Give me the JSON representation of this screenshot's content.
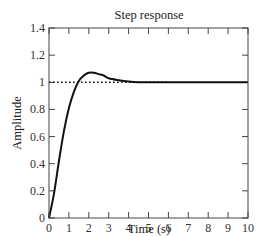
{
  "chart_data": {
    "type": "line",
    "title": "Step response",
    "xlabel": "Time (s)",
    "ylabel": "Amplitude",
    "xlim": [
      0,
      10
    ],
    "ylim": [
      0,
      1.4
    ],
    "grid": false,
    "xticks": [
      "0",
      "1",
      "2",
      "3",
      "4",
      "5",
      "6",
      "7",
      "8",
      "9",
      "10"
    ],
    "yticks": [
      "0",
      "0.2",
      "0.4",
      "0.6",
      "0.8",
      "1",
      "1.2",
      "1.4"
    ],
    "series": [
      {
        "name": "step response",
        "style": "solid",
        "color": "#111111",
        "x": [
          0,
          0.25,
          0.5,
          0.75,
          1.0,
          1.25,
          1.5,
          1.75,
          2.0,
          2.25,
          2.5,
          2.75,
          3.0,
          3.5,
          4.0,
          4.5,
          5.0,
          6.0,
          7.0,
          8.0,
          9.0,
          10.0
        ],
        "values": [
          0,
          0.18,
          0.42,
          0.64,
          0.81,
          0.93,
          1.01,
          1.05,
          1.07,
          1.07,
          1.06,
          1.05,
          1.03,
          1.015,
          1.005,
          1.0,
          1.0,
          1.0,
          1.0,
          1.0,
          1.0,
          1.0
        ]
      },
      {
        "name": "reference",
        "style": "dotted",
        "color": "#111111",
        "x": [
          0,
          6
        ],
        "values": [
          1,
          1
        ]
      }
    ]
  }
}
